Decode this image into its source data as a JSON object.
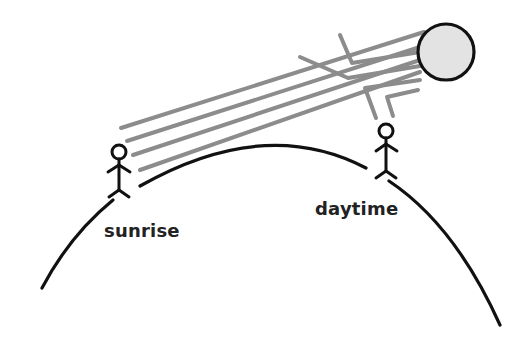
{
  "diagram": {
    "type": "illustration",
    "labels": {
      "sunrise": "sunrise",
      "daytime": "daytime"
    },
    "elements": {
      "sun": "sun-circle",
      "earth": "earth-surface-arc",
      "observers": [
        "sunrise-observer",
        "daytime-observer"
      ],
      "rays_to_sunrise": 4,
      "rays_to_daytime": 2
    },
    "colors": {
      "sun_fill": "#e3e3e3",
      "outline": "#111111",
      "ray": "#8c8c8c",
      "text": "#222222"
    }
  }
}
